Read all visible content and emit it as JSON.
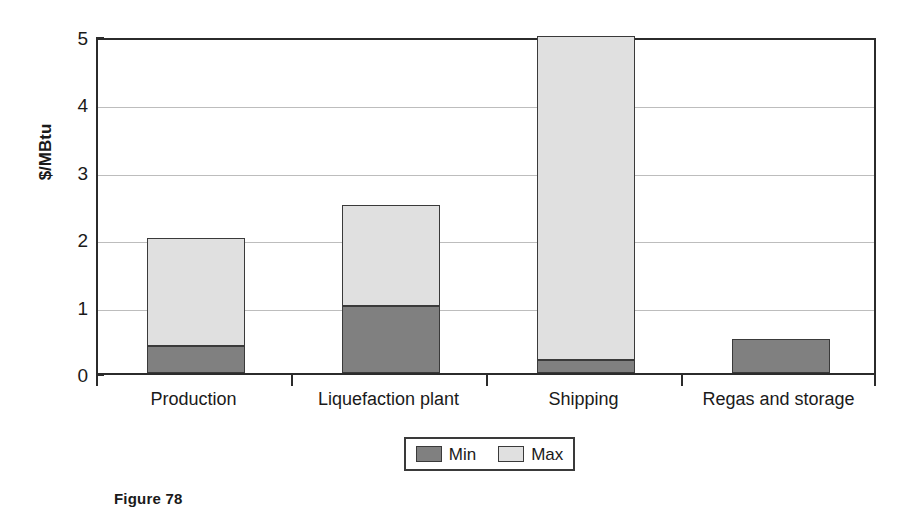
{
  "chart_data": {
    "type": "bar",
    "subtype": "stacked",
    "title": "",
    "xlabel": "",
    "ylabel": "$/MBtu",
    "ylim": [
      0,
      5
    ],
    "yticks": [
      0,
      1,
      2,
      3,
      4,
      5
    ],
    "ytick_labels": [
      "0",
      "1",
      "2",
      "3",
      "4",
      "5"
    ],
    "grid": true,
    "grid_axis": "y",
    "legend_position": "bottom-center",
    "categories": [
      "Production",
      "Liquefaction plant",
      "Shipping",
      "Regas and storage"
    ],
    "series": [
      {
        "name": "Min",
        "color": "#808080",
        "values": [
          0.4,
          1.0,
          0.2,
          0.5
        ]
      },
      {
        "name": "Max",
        "color": "#e0e0e0",
        "values": [
          1.6,
          1.5,
          4.8,
          0.0
        ]
      }
    ],
    "totals": [
      2.0,
      2.5,
      5.0,
      0.5
    ]
  },
  "caption": {
    "text": "Figure 78"
  },
  "colors": {
    "min_fill": "#808080",
    "max_fill": "#e0e0e0",
    "bar_border": "#3a3a3a",
    "axis": "#2b2b2b",
    "gridline": "#bdbdbd",
    "background": "#ffffff",
    "text": "#1a1a1a"
  }
}
